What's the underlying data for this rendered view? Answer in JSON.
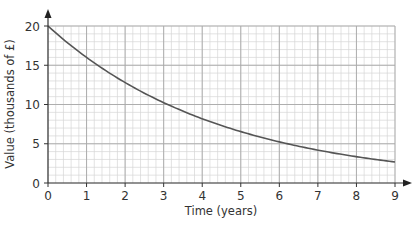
{
  "chart_data": {
    "type": "line",
    "title": "",
    "xlabel": "Time (years)",
    "ylabel": "Value (thousands of £)",
    "xlim": [
      0,
      9
    ],
    "ylim": [
      0,
      20
    ],
    "x_ticks": [
      0,
      1,
      2,
      3,
      4,
      5,
      6,
      7,
      8,
      9
    ],
    "y_ticks": [
      0,
      5,
      10,
      15,
      20
    ],
    "grid": true,
    "grid_minor_x": 0.2,
    "grid_minor_y": 1,
    "legend": null,
    "series": [
      {
        "name": "Value",
        "x": [
          0,
          1,
          2,
          3,
          4,
          5,
          6,
          7,
          8,
          9
        ],
        "values": [
          20,
          16,
          12.8,
          10.24,
          8.19,
          6.55,
          5.24,
          4.19,
          3.36,
          2.68
        ],
        "color": "#555555"
      }
    ]
  },
  "colors": {
    "curve": "#555555",
    "axis": "#333333",
    "grid_major": "#a8a8a8",
    "grid_minor": "#d6d6d6"
  }
}
